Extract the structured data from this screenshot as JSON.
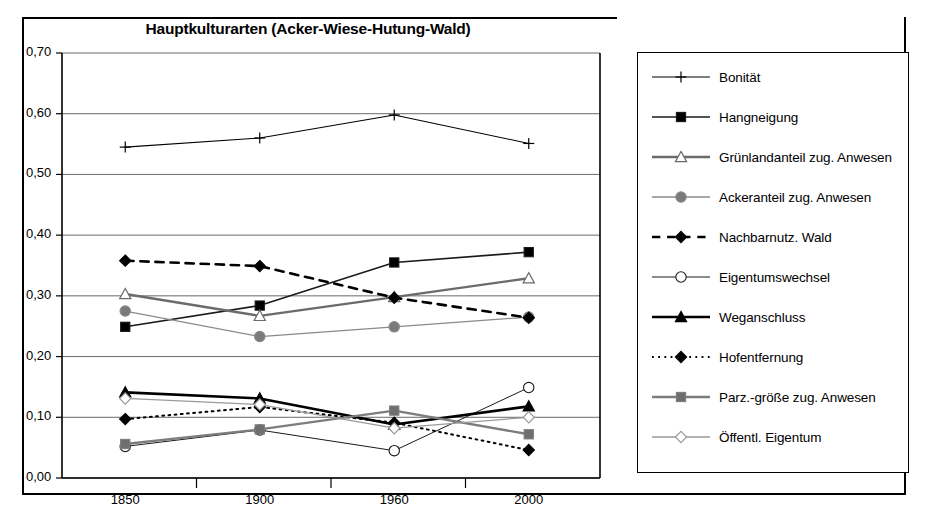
{
  "chart_data": {
    "type": "line",
    "title": "Hauptkulturarten (Acker-Wiese-Hutung-Wald)",
    "xlabel": "",
    "ylabel": "",
    "categories": [
      "1850",
      "1900",
      "1960",
      "2000"
    ],
    "ylim": [
      0.0,
      0.7
    ],
    "ytick_labels": [
      "0,00",
      "0,10",
      "0,20",
      "0,30",
      "0,40",
      "0,50",
      "0,60",
      "0,70"
    ],
    "ytick_values": [
      0.0,
      0.1,
      0.2,
      0.3,
      0.4,
      0.5,
      0.6,
      0.7
    ],
    "grid": "horizontal",
    "legend_position": "right",
    "series": [
      {
        "name": "Bonität",
        "values": [
          0.545,
          0.56,
          0.598,
          0.551
        ],
        "marker": "plus",
        "line_style": "solid",
        "color": "#000000",
        "line_width": 1.1,
        "marker_fill": "none"
      },
      {
        "name": "Hangneigung",
        "values": [
          0.249,
          0.284,
          0.355,
          0.372
        ],
        "marker": "square",
        "line_style": "solid",
        "color": "#1a1a1a",
        "line_width": 1.6,
        "marker_fill": "#000000"
      },
      {
        "name": "Grünlandanteil zug. Anwesen",
        "values": [
          0.303,
          0.267,
          0.298,
          0.329
        ],
        "marker": "triangle",
        "line_style": "solid",
        "color": "#6b6b6b",
        "line_width": 2.4,
        "marker_fill": "#ffffff"
      },
      {
        "name": "Ackeranteil zug. Anwesen",
        "values": [
          0.275,
          0.233,
          0.249,
          0.265
        ],
        "marker": "circle",
        "line_style": "solid",
        "color": "#8a8a8a",
        "line_width": 1.3,
        "marker_fill": "#7a7a7a"
      },
      {
        "name": "Nachbarnutz. Wald",
        "values": [
          0.358,
          0.349,
          0.297,
          0.264
        ],
        "marker": "diamond",
        "line_style": "dashed",
        "color": "#000000",
        "line_width": 2.6,
        "marker_fill": "#000000"
      },
      {
        "name": "Eigentumswechsel",
        "values": [
          0.052,
          0.079,
          0.045,
          0.149
        ],
        "marker": "circle",
        "line_style": "solid",
        "color": "#1a1a1a",
        "line_width": 1.0,
        "marker_fill": "#ffffff"
      },
      {
        "name": "Weganschluss",
        "values": [
          0.141,
          0.131,
          0.088,
          0.118
        ],
        "marker": "triangle",
        "line_style": "solid",
        "color": "#000000",
        "line_width": 2.6,
        "marker_fill": "#000000"
      },
      {
        "name": "Hofentfernung",
        "values": [
          0.097,
          0.117,
          0.091,
          0.046
        ],
        "marker": "diamond",
        "line_style": "dotted",
        "color": "#000000",
        "line_width": 2.0,
        "marker_fill": "#000000"
      },
      {
        "name": "Parz.-größe zug. Anwesen",
        "values": [
          0.056,
          0.08,
          0.111,
          0.072
        ],
        "marker": "square",
        "line_style": "solid",
        "color": "#7d7d7d",
        "line_width": 2.4,
        "marker_fill": "#6e6e6e"
      },
      {
        "name": "Öffentl. Eigentum",
        "values": [
          0.131,
          0.121,
          0.082,
          0.1
        ],
        "marker": "diamond",
        "line_style": "solid",
        "color": "#9a9a9a",
        "line_width": 1.3,
        "marker_fill": "#ffffff"
      }
    ]
  }
}
